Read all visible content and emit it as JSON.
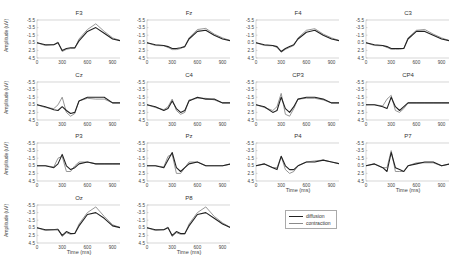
{
  "chart_data": {
    "type": "line",
    "layout": "grid 4x4 small multiples",
    "xlabel": "Time (ms)",
    "ylabel": "Amplitude (uV)",
    "xlim": [
      0,
      1000
    ],
    "ylim": [
      4.5,
      -5.5
    ],
    "y_inverted": true,
    "xticks": [
      0,
      300,
      600,
      900
    ],
    "yticks": [
      -5.5,
      -3.5,
      -1.5,
      0.5,
      2.5,
      4.5
    ],
    "ytick_labels": [
      "-5.5",
      "-3.5",
      "-1.5",
      "0.5",
      "2.5",
      "4.5"
    ],
    "xtick_labels": [
      "0",
      "300",
      "600",
      "900"
    ],
    "grid": false,
    "legend": {
      "position": "bottom-right area (row 4, col 3)",
      "entries": [
        "diffusion",
        "contraction"
      ]
    },
    "series_colors": {
      "diffusion": "#222222",
      "contraction": "#8a8a8a"
    },
    "x": [
      0,
      100,
      200,
      250,
      300,
      350,
      400,
      450,
      500,
      600,
      700,
      800,
      900,
      1000
    ],
    "panels": [
      {
        "title": "F3",
        "series": [
          {
            "name": "diffusion",
            "values": [
              0.5,
              1.0,
              1.0,
              0.5,
              2.5,
              2.0,
              1.8,
              1.8,
              0,
              -2.5,
              -3.5,
              -2.0,
              -0.5,
              0
            ]
          },
          {
            "name": "contraction",
            "values": [
              0.5,
              1.2,
              1.0,
              0.3,
              2.8,
              2.2,
              2.0,
              2.0,
              -0.5,
              -3.0,
              -4.5,
              -2.5,
              -0.8,
              0
            ]
          }
        ]
      },
      {
        "title": "Fz",
        "series": [
          {
            "name": "diffusion",
            "values": [
              0.5,
              1.0,
              1.2,
              1.5,
              2.0,
              2.0,
              1.8,
              1.5,
              -0.5,
              -2.5,
              -2.8,
              -1.5,
              -0.5,
              0
            ]
          },
          {
            "name": "contraction",
            "values": [
              0.5,
              1.2,
              1.3,
              1.7,
              2.3,
              2.3,
              2.0,
              1.5,
              -0.8,
              -3.0,
              -3.3,
              -1.8,
              -0.8,
              0
            ]
          }
        ]
      },
      {
        "title": "F4",
        "series": [
          {
            "name": "diffusion",
            "values": [
              0.5,
              1.0,
              1.2,
              1.5,
              2.8,
              2.0,
              1.5,
              1.0,
              -0.5,
              -2.3,
              -2.8,
              -1.5,
              -0.5,
              0
            ]
          },
          {
            "name": "contraction",
            "values": [
              0.5,
              1.2,
              1.3,
              1.7,
              3.0,
              2.2,
              1.7,
              1.2,
              -0.8,
              -2.8,
              -3.2,
              -1.8,
              -0.8,
              0
            ]
          }
        ]
      },
      {
        "title": "C3",
        "series": [
          {
            "name": "diffusion",
            "values": [
              0.5,
              1.0,
              1.2,
              1.5,
              2.0,
              2.0,
              2.0,
              2.0,
              -0.5,
              -2.5,
              -2.5,
              -1.5,
              -0.5,
              0
            ]
          },
          {
            "name": "contraction",
            "values": [
              0.5,
              1.2,
              1.3,
              1.7,
              2.2,
              2.2,
              2.2,
              2.0,
              -0.8,
              -2.8,
              -3.0,
              -1.8,
              -0.8,
              0
            ]
          }
        ]
      },
      {
        "title": "Cz",
        "series": [
          {
            "name": "diffusion",
            "values": [
              0.5,
              1.0,
              1.8,
              2.0,
              1.0,
              2.0,
              2.8,
              2.5,
              -0.5,
              -1.5,
              -1.5,
              -1.5,
              0,
              0
            ]
          },
          {
            "name": "contraction",
            "values": [
              0.5,
              1.2,
              1.5,
              0.5,
              -1.5,
              2.5,
              3.5,
              2.8,
              -0.5,
              -1.2,
              -1.0,
              -1.0,
              0,
              0
            ]
          }
        ]
      },
      {
        "title": "C4",
        "series": [
          {
            "name": "diffusion",
            "values": [
              0.5,
              1.0,
              2.0,
              1.5,
              -0.5,
              1.5,
              2.5,
              2.0,
              -0.5,
              -1.5,
              -1.0,
              -1.0,
              0,
              0
            ]
          },
          {
            "name": "contraction",
            "values": [
              0.5,
              1.2,
              1.8,
              1.0,
              -1.0,
              2.0,
              3.0,
              2.5,
              -0.8,
              -1.2,
              -1.2,
              -0.8,
              0,
              0
            ]
          }
        ]
      },
      {
        "title": "CP3",
        "series": [
          {
            "name": "diffusion",
            "values": [
              0.5,
              1.0,
              2.5,
              2.0,
              -1.5,
              1.5,
              2.5,
              1.0,
              -1.0,
              -1.5,
              -1.5,
              -1.0,
              0,
              0
            ]
          },
          {
            "name": "contraction",
            "values": [
              0.5,
              1.2,
              2.0,
              1.0,
              -2.5,
              3.0,
              3.5,
              1.5,
              -1.0,
              -1.2,
              -1.2,
              -0.8,
              0,
              0
            ]
          }
        ]
      },
      {
        "title": "CP4",
        "series": [
          {
            "name": "diffusion",
            "values": [
              0.5,
              0.5,
              1.0,
              1.5,
              -1.5,
              1.0,
              2.0,
              1.0,
              0,
              0,
              0,
              0,
              0,
              0
            ]
          },
          {
            "name": "contraction",
            "values": [
              0.5,
              0.5,
              0.8,
              -1.0,
              -2.0,
              2.0,
              2.5,
              1.5,
              0,
              0,
              0,
              0,
              0,
              0
            ]
          }
        ]
      },
      {
        "title": "P3",
        "series": [
          {
            "name": "diffusion",
            "values": [
              0.5,
              0.5,
              1.0,
              0,
              -2.5,
              0.5,
              1.5,
              1.0,
              0,
              -0.5,
              0,
              0,
              0,
              0
            ]
          },
          {
            "name": "contraction",
            "values": [
              0.5,
              0.5,
              0.8,
              -1.5,
              -2.0,
              2.0,
              2.0,
              0.5,
              -0.5,
              -0.5,
              0,
              0,
              0,
              0
            ]
          }
        ]
      },
      {
        "title": "Pz",
        "series": [
          {
            "name": "diffusion",
            "values": [
              0.5,
              0.5,
              1.0,
              -1.0,
              -3.0,
              1.0,
              2.0,
              1.0,
              0,
              -0.5,
              0.5,
              0.5,
              0.5,
              0
            ]
          },
          {
            "name": "contraction",
            "values": [
              0.5,
              0.5,
              0.8,
              -2.0,
              -2.5,
              2.5,
              2.5,
              1.0,
              -0.5,
              -0.5,
              0.5,
              0.5,
              0.5,
              0
            ]
          }
        ]
      },
      {
        "title": "P4",
        "series": [
          {
            "name": "diffusion",
            "values": [
              0.5,
              0,
              1.0,
              1.5,
              -2.0,
              0.5,
              1.5,
              1.5,
              0.5,
              -0.5,
              -0.5,
              -1.0,
              -0.5,
              0
            ]
          },
          {
            "name": "contraction",
            "values": [
              0.5,
              0,
              1.0,
              1.0,
              -2.0,
              1.5,
              2.5,
              2.0,
              0.5,
              -0.5,
              -0.8,
              -1.0,
              -0.5,
              0
            ]
          }
        ]
      },
      {
        "title": "P7",
        "series": [
          {
            "name": "diffusion",
            "values": [
              0.5,
              0,
              1.0,
              2.0,
              -3.0,
              1.0,
              1.5,
              2.0,
              0.5,
              0,
              -0.5,
              -0.5,
              0.5,
              0
            ]
          },
          {
            "name": "contraction",
            "values": [
              0.5,
              0,
              1.0,
              1.0,
              -3.5,
              2.0,
              2.0,
              2.0,
              0.5,
              -0.3,
              -0.3,
              -0.3,
              0.5,
              0
            ]
          }
        ]
      },
      {
        "title": "Oz",
        "series": [
          {
            "name": "diffusion",
            "values": [
              0.5,
              1.0,
              1.0,
              1.0,
              2.5,
              1.5,
              2.0,
              2.0,
              0,
              -3.0,
              -3.5,
              -2.0,
              0,
              0.5
            ]
          },
          {
            "name": "contraction",
            "values": [
              0.5,
              1.2,
              1.0,
              0.8,
              2.8,
              1.8,
              2.2,
              2.0,
              -0.5,
              -3.5,
              -5.0,
              -2.5,
              -0.3,
              0.5
            ]
          }
        ]
      },
      {
        "title": "P8",
        "series": [
          {
            "name": "diffusion",
            "values": [
              0.5,
              1.0,
              1.0,
              0.5,
              2.5,
              1.5,
              2.0,
              2.0,
              0,
              -3.0,
              -3.5,
              -2.0,
              -0.5,
              0.5
            ]
          },
          {
            "name": "contraction",
            "values": [
              0.5,
              1.2,
              1.0,
              0.3,
              2.8,
              1.8,
              2.2,
              2.2,
              -0.5,
              -3.5,
              -5.0,
              -2.5,
              -0.8,
              0.5
            ]
          }
        ]
      }
    ]
  }
}
